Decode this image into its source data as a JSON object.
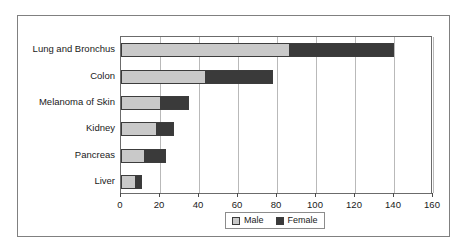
{
  "chart_data": {
    "type": "bar",
    "orientation": "horizontal",
    "stacked": true,
    "title": "",
    "xlabel": "",
    "ylabel": "",
    "xlim": [
      0,
      160
    ],
    "xticks": [
      0,
      20,
      40,
      60,
      80,
      100,
      120,
      140,
      160
    ],
    "xtick_labels": [
      "0",
      "20",
      "40",
      "60",
      "80",
      "100",
      "120",
      "140",
      "160"
    ],
    "grid": true,
    "grid_axis": "x",
    "legend_position": "bottom-center",
    "categories": [
      "Lung and Bronchus",
      "Colon",
      "Melanoma of Skin",
      "Kidney",
      "Pancreas",
      "Liver"
    ],
    "series": [
      {
        "name": "Male",
        "color": "#c9c9c9",
        "values": [
          86,
          43,
          20,
          18,
          12,
          7
        ]
      },
      {
        "name": "Female",
        "color": "#3a3a3a",
        "values": [
          54,
          35,
          15,
          9,
          11,
          4
        ]
      }
    ],
    "totals": [
      140,
      78,
      35,
      27,
      23,
      11
    ]
  },
  "legend": {
    "items": [
      {
        "label": "Male",
        "swatch": "male-swatch"
      },
      {
        "label": "Female",
        "swatch": "female-swatch"
      }
    ]
  },
  "colors": {
    "male": "#c9c9c9",
    "female": "#3a3a3a",
    "gridline": "#b9b9b9",
    "axis": "#6b6b6b",
    "frame": "#808080",
    "text": "#1a1a1a",
    "background": "#ffffff"
  }
}
